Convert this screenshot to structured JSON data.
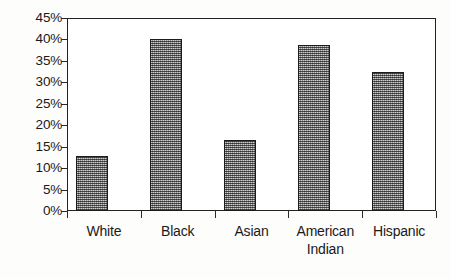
{
  "chart_data": {
    "type": "bar",
    "title": "",
    "subtitle": "",
    "xlabel": "",
    "ylabel": "",
    "categories": [
      "White",
      "Black",
      "Asian",
      "American\nIndian",
      "Hispanic"
    ],
    "values": [
      12.8,
      40.0,
      16.5,
      38.8,
      32.5
    ],
    "value_labels": [
      "",
      "",
      "",
      "",
      ""
    ],
    "ylim": [
      0,
      45
    ],
    "ytick_values": [
      0,
      5,
      10,
      15,
      20,
      25,
      30,
      35,
      40,
      45
    ],
    "ytick_labels": [
      "0%",
      "5%",
      "10%",
      "15%",
      "20%",
      "25%",
      "30%",
      "35%",
      "40%",
      "45%"
    ],
    "grid": false,
    "legend": null,
    "legend_position": "none",
    "annotations": [],
    "series": [
      {
        "name": "",
        "values": [
          12.8,
          40.0,
          16.5,
          38.8,
          32.5
        ]
      }
    ]
  },
  "style": {
    "bar_fill_color": "#8e8e8e",
    "bar_border_color": "#1c1c1c",
    "axis_color": "#222222",
    "text_color": "#1a1a1a",
    "plot_background": "#ffffff",
    "page_background": "#fdfdfc"
  }
}
